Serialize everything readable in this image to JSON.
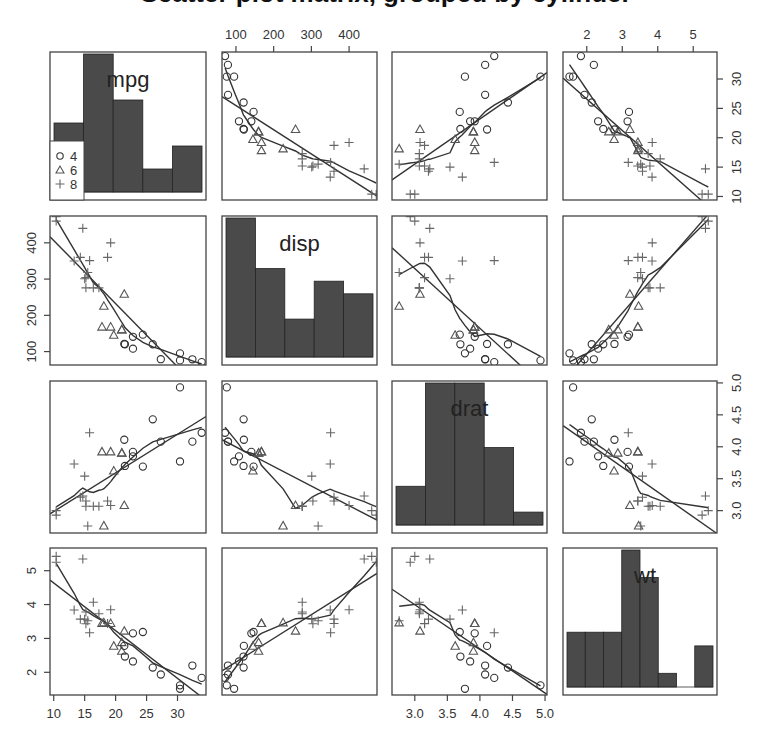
{
  "chart_data": {
    "type": "scatter",
    "title": "Scatter plot matrix, grouped by cylinder",
    "variables": [
      "mpg",
      "disp",
      "drat",
      "wt"
    ],
    "group_variable": "cyl",
    "legend": {
      "position": "inside top-left panel, lower-left",
      "entries": [
        {
          "label": "4",
          "marker": "circle"
        },
        {
          "label": "6",
          "marker": "triangle"
        },
        {
          "label": "8",
          "marker": "plus"
        }
      ]
    },
    "axes": {
      "mpg": {
        "range": [
          9.4,
          34.6
        ],
        "ticks": [
          10,
          15,
          20,
          25,
          30
        ],
        "tick_side_x": "bottom",
        "tick_side_y": "right"
      },
      "disp": {
        "range": [
          63,
          474
        ],
        "ticks": [
          100,
          200,
          300,
          400
        ],
        "tick_side_x": "top",
        "tick_side_y": "left"
      },
      "drat": {
        "range": [
          2.65,
          5.03
        ],
        "ticks": [
          3.0,
          3.5,
          4.0,
          4.5,
          5.0
        ],
        "tick_side_x": "bottom",
        "tick_side_y": "right"
      },
      "wt": {
        "range": [
          1.33,
          5.67
        ],
        "ticks": [
          2,
          3,
          4,
          5
        ],
        "tick_side_x": "top",
        "tick_side_y": "left"
      }
    },
    "diagonal": "histogram",
    "histograms": {
      "mpg": {
        "breaks": [
          10,
          15,
          20,
          25,
          30,
          35
        ],
        "counts": [
          6,
          12,
          8,
          2,
          4
        ]
      },
      "disp": {
        "breaks": [
          50,
          150,
          250,
          350,
          450,
          500
        ],
        "counts": [
          11,
          7,
          3,
          6,
          5
        ]
      },
      "drat": {
        "breaks": [
          2.5,
          3,
          3.5,
          4,
          4.5,
          5
        ],
        "counts": [
          3,
          11,
          11,
          6,
          1
        ]
      },
      "wt": {
        "breaks": [
          1.5,
          2,
          2.5,
          3,
          3.5,
          4,
          4.5,
          5,
          5.5
        ],
        "counts": [
          4,
          4,
          4,
          10,
          8,
          1,
          0,
          3
        ]
      }
    },
    "fits": [
      "linear regression line",
      "loess smooth"
    ],
    "points": {
      "mpg": [
        21.0,
        21.0,
        22.8,
        21.4,
        18.7,
        18.1,
        14.3,
        24.4,
        22.8,
        19.2,
        17.8,
        16.4,
        17.3,
        15.2,
        10.4,
        10.4,
        14.7,
        32.4,
        30.4,
        33.9,
        21.5,
        15.5,
        15.2,
        13.3,
        19.2,
        27.3,
        26.0,
        30.4,
        15.8,
        19.7,
        15.0,
        21.4
      ],
      "disp": [
        160,
        160,
        108,
        258,
        360,
        225,
        360,
        146.7,
        140.8,
        167.6,
        167.6,
        275.8,
        275.8,
        275.8,
        472,
        460,
        440,
        78.7,
        75.7,
        71.1,
        120.1,
        318,
        304,
        350,
        400,
        79,
        120.3,
        95.1,
        351,
        145,
        301,
        121
      ],
      "drat": [
        3.9,
        3.9,
        3.85,
        3.08,
        3.15,
        2.76,
        3.21,
        3.69,
        3.92,
        3.92,
        3.92,
        3.07,
        3.07,
        3.07,
        2.93,
        3.0,
        3.23,
        4.08,
        4.93,
        4.22,
        3.7,
        2.76,
        3.15,
        3.73,
        3.08,
        4.08,
        4.43,
        3.77,
        4.22,
        3.62,
        3.54,
        4.11
      ],
      "wt": [
        2.62,
        2.875,
        2.32,
        3.215,
        3.44,
        3.46,
        3.57,
        3.19,
        3.15,
        3.44,
        3.44,
        4.07,
        3.73,
        3.78,
        5.25,
        5.424,
        5.345,
        2.2,
        1.615,
        1.835,
        2.465,
        3.52,
        3.435,
        3.84,
        3.845,
        1.935,
        2.14,
        1.513,
        3.17,
        2.77,
        3.57,
        2.78
      ],
      "cyl": [
        6,
        6,
        4,
        6,
        8,
        6,
        8,
        4,
        4,
        6,
        6,
        8,
        8,
        8,
        8,
        8,
        8,
        4,
        4,
        4,
        4,
        8,
        8,
        8,
        8,
        4,
        4,
        4,
        8,
        6,
        8,
        4
      ]
    }
  },
  "labels": {
    "title": "Scatter plot matrix, grouped by cylinder",
    "diag": [
      "mpg",
      "disp",
      "drat",
      "wt"
    ],
    "legend": [
      "4",
      "6",
      "8"
    ]
  }
}
